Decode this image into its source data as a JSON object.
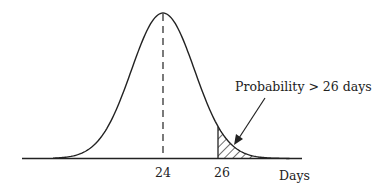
{
  "chart_data": {
    "type": "area",
    "title": "",
    "distribution": {
      "mean": 24,
      "std_dev_estimate": 1.15
    },
    "xlabel": "Days",
    "ylabel": "",
    "x_ticks": [
      {
        "value": 24,
        "label": "24"
      },
      {
        "value": 26,
        "label": "26"
      }
    ],
    "shaded_region": {
      "from": 26,
      "to": null,
      "pattern": "diagonal-hatch"
    },
    "mean_line": {
      "x": 24,
      "style": "dashed"
    },
    "annotations": [
      {
        "text": "Probability > 26 days",
        "points_to": "shaded_region"
      }
    ],
    "grid": false,
    "legend": null
  },
  "labels": {
    "x_axis": "Days",
    "tick_mean": "24",
    "tick_threshold": "26",
    "annotation": "Probability > 26 days"
  },
  "colors": {
    "ink": "#222222",
    "background": "#ffffff"
  }
}
